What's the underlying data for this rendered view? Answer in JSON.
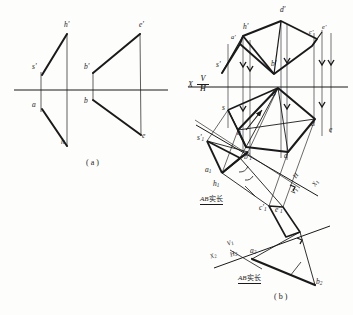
{
  "figure": {
    "panel_a_caption": "( a )",
    "panel_b_caption": "( b )",
    "ink_color": "#1a1a1a",
    "paper_color": "#fdfdfc"
  },
  "panel_a": {
    "caption": "( a )",
    "labels": [
      {
        "id": "h-prime",
        "text": "h",
        "prime": "'",
        "x": 66,
        "y": 26
      },
      {
        "id": "s-prime",
        "text": "s",
        "prime": "'",
        "x": 35,
        "y": 68
      },
      {
        "id": "a",
        "text": "a",
        "prime": "",
        "x": 35,
        "y": 106
      },
      {
        "id": "h",
        "text": "h",
        "prime": "",
        "x": 63,
        "y": 143
      },
      {
        "id": "b-prime",
        "text": "b",
        "prime": "'",
        "x": 89,
        "y": 68
      },
      {
        "id": "b",
        "text": "b",
        "prime": "",
        "x": 89,
        "y": 102
      },
      {
        "id": "e-prime",
        "text": "e",
        "prime": "'",
        "x": 140,
        "y": 26
      },
      {
        "id": "e",
        "text": "e",
        "prime": "",
        "x": 143,
        "y": 137
      }
    ]
  },
  "panel_b": {
    "caption": "( b )",
    "axis_primary": {
      "x_label": "X",
      "v_label": "V",
      "h_label": "H"
    },
    "axis_secondary": {
      "x_label": "X",
      "x_sub": "1",
      "v_label": "V",
      "v_sub": "1",
      "h_label": "H"
    },
    "axis_tertiary": {
      "x_label": "X",
      "x_sub": "2",
      "h_label": "H",
      "h_sub": "2",
      "v_label": "V",
      "v_sub": "1"
    },
    "annotation_upper": {
      "italic": "AB",
      "cn": "实长"
    },
    "annotation_lower": {
      "italic": "AB",
      "cn": "实长"
    },
    "labels": [
      {
        "id": "d-prime",
        "text": "d",
        "prime": "'",
        "sub": "",
        "x": 281,
        "y": 12
      },
      {
        "id": "h-prime-b",
        "text": "h",
        "prime": "'",
        "sub": "",
        "x": 245,
        "y": 29
      },
      {
        "id": "a-prime-b",
        "text": "a",
        "prime": "'",
        "sub": "",
        "x": 236,
        "y": 38
      },
      {
        "id": "c-prime",
        "text": "c",
        "prime": "'",
        "sub": "",
        "x": 312,
        "y": 32
      },
      {
        "id": "e-prime-b",
        "text": "e",
        "prime": "'",
        "sub": "",
        "x": 324,
        "y": 29
      },
      {
        "id": "s-prime-b",
        "text": "s",
        "prime": "'",
        "sub": "",
        "x": 219,
        "y": 66
      },
      {
        "id": "b-prime-b",
        "text": "b",
        "prime": "'",
        "sub": "",
        "x": 273,
        "y": 66
      },
      {
        "id": "b-b",
        "text": "b",
        "prime": "",
        "sub": "",
        "x": 274,
        "y": 95
      },
      {
        "id": "s-b",
        "text": "s",
        "prime": "",
        "sub": "",
        "x": 224,
        "y": 111
      },
      {
        "id": "a-b",
        "text": "a",
        "prime": "",
        "sub": "",
        "x": 240,
        "y": 135
      },
      {
        "id": "c-b",
        "text": "c",
        "prime": "",
        "sub": "",
        "x": 313,
        "y": 126
      },
      {
        "id": "e-b",
        "text": "e",
        "prime": "",
        "sub": "",
        "x": 330,
        "y": 131
      },
      {
        "id": "d-b",
        "text": "d",
        "prime": "",
        "sub": "",
        "x": 285,
        "y": 158
      },
      {
        "id": "s1-prime",
        "text": "s",
        "prime": "'",
        "sub": "1",
        "x": 200,
        "y": 140
      },
      {
        "id": "b1-prime",
        "text": "b",
        "prime": "'",
        "sub": "1",
        "x": 246,
        "y": 159
      },
      {
        "id": "a1",
        "text": "a",
        "prime": "",
        "sub": "1",
        "x": 208,
        "y": 172
      },
      {
        "id": "h1",
        "text": "h",
        "prime": "",
        "sub": "1",
        "x": 216,
        "y": 186
      },
      {
        "id": "c1-prime",
        "text": "c",
        "prime": "'",
        "sub": "1",
        "x": 262,
        "y": 210
      },
      {
        "id": "e1-prime",
        "text": "e",
        "prime": "'",
        "sub": "1",
        "x": 277,
        "y": 212
      },
      {
        "id": "a2",
        "text": "a",
        "prime": "",
        "sub": "2",
        "x": 252,
        "y": 253
      },
      {
        "id": "b2",
        "text": "b",
        "prime": "",
        "sub": "2",
        "x": 317,
        "y": 283
      }
    ]
  },
  "geometry": {
    "panel_a": {
      "ground_line": {
        "x1": 14,
        "y1": 90,
        "x2": 168,
        "y2": 90
      },
      "thick_segments": [
        [
          [
            41,
            74
          ],
          [
            66,
            34
          ]
        ],
        [
          [
            41,
            110
          ],
          [
            66,
            146
          ]
        ],
        [
          [
            93,
            73
          ],
          [
            140,
            34
          ]
        ],
        [
          [
            93,
            99
          ],
          [
            141,
            134
          ]
        ]
      ],
      "thin_segments": [
        [
          [
            41,
            74
          ],
          [
            41,
            110
          ]
        ],
        [
          [
            66,
            34
          ],
          [
            66,
            146
          ]
        ],
        [
          [
            93,
            73
          ],
          [
            93,
            99
          ]
        ],
        [
          [
            140,
            34
          ],
          [
            141,
            134
          ]
        ]
      ]
    },
    "panel_b": {
      "ground_line": {
        "x1": 188,
        "y1": 87,
        "x2": 348,
        "y2": 87
      },
      "upper_polygon": [
        [
          243,
          36
        ],
        [
          281,
          21
        ],
        [
          317,
          40
        ],
        [
          311,
          47
        ],
        [
          274,
          74
        ],
        [
          239,
          44
        ]
      ],
      "lower_polygon": [
        [
          278,
          88
        ],
        [
          314,
          118
        ],
        [
          288,
          152
        ],
        [
          245,
          148
        ],
        [
          239,
          130
        ]
      ],
      "projector_color": "#555555"
    }
  }
}
